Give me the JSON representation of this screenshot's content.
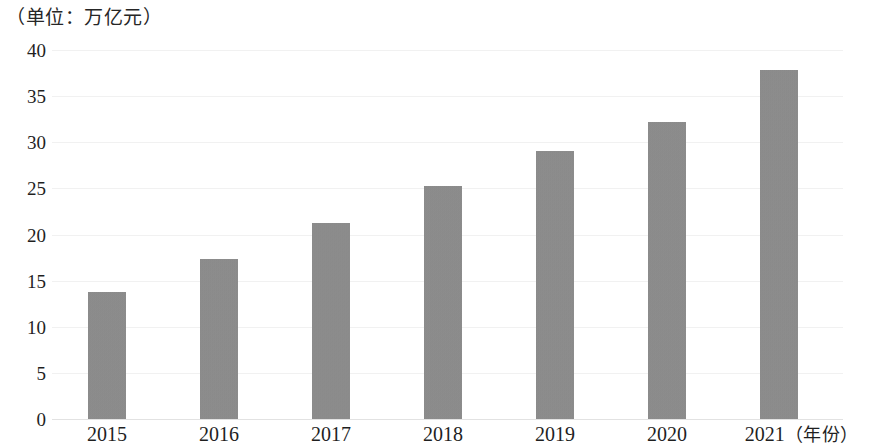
{
  "chart_data": {
    "type": "bar",
    "title": "（单位：万亿元）",
    "xlabel": "（年份）",
    "ylabel": "",
    "categories": [
      "2015",
      "2016",
      "2017",
      "2018",
      "2019",
      "2020",
      "2021"
    ],
    "values": [
      13.8,
      17.3,
      21.3,
      25.3,
      29.0,
      32.2,
      37.8
    ],
    "ylim": [
      0,
      40
    ],
    "yticks": [
      "0",
      "5",
      "10",
      "15",
      "20",
      "25",
      "30",
      "35",
      "40"
    ],
    "ytick_values": [
      0,
      5,
      10,
      15,
      20,
      25,
      30,
      35,
      40
    ],
    "grid": true,
    "legend": "none",
    "bar_color": "#8c8c8c",
    "grid_color": "#f1f1f1",
    "axis_color": "#e2e2e2",
    "background": "#ffffff"
  },
  "axis": {
    "unit_label": "（单位：万亿元）",
    "x_axis_name": "（年份）",
    "last_category_with_axis_name": "2021（年份）"
  }
}
